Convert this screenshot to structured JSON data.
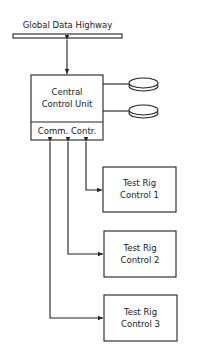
{
  "highway": {
    "label": "Global Data Highway"
  },
  "central_unit": {
    "line1": "Central",
    "line2": "Control Unit",
    "sub_label": "Comm. Contr."
  },
  "storage": [
    {
      "name": "disk-1"
    },
    {
      "name": "disk-2"
    }
  ],
  "test_rigs": [
    {
      "line1": "Test Rig",
      "line2": "Control 1"
    },
    {
      "line1": "Test Rig",
      "line2": "Control 2"
    },
    {
      "line1": "Test Rig",
      "line2": "Control 3"
    }
  ]
}
